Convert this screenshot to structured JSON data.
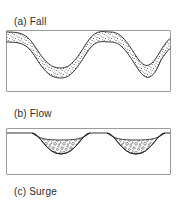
{
  "figure": {
    "kind": "schematic-diagram",
    "background_color": "#ffffff",
    "line_color": "#1a1a1a",
    "stipple_color": "#2b2b2b",
    "panels": [
      {
        "id": "a",
        "caption": "(a) Fall",
        "description": "Fine stippled fall deposit of uniform thickness mantling a wavy topographic surface",
        "fill_texture": "fine-stipple",
        "deposit_style": "mantling-drape"
      },
      {
        "id": "b",
        "caption": "(b) Flow",
        "description": "Coarse granular flow deposit ponded in the two topographic lows, absent on highs",
        "fill_texture": "coarse-clast",
        "deposit_style": "valley-ponded"
      },
      {
        "id": "c",
        "caption": "(c) Surge",
        "description": "Surge panel caption only; panel body cropped below image edge",
        "fill_texture": "none",
        "deposit_style": "none"
      }
    ]
  },
  "captions": {
    "fall": "(a) Fall",
    "flow": "(b) Flow",
    "surge": "(c) Surge"
  }
}
